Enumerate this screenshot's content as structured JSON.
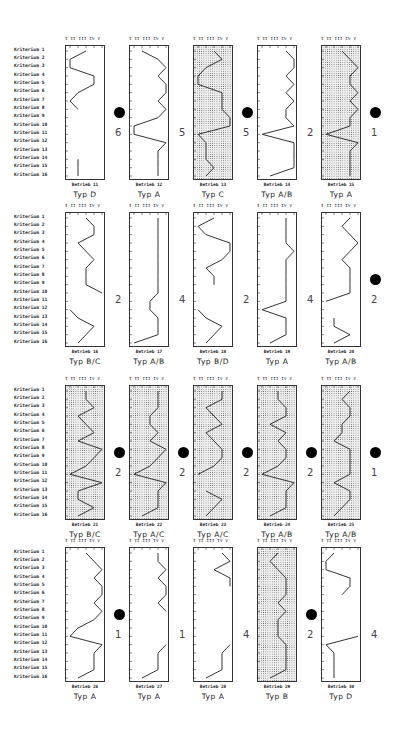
{
  "axis_label": "I  II III IV  V",
  "criteria": [
    "Kriterium  1",
    "Kriterium  2",
    "Kriterium  3",
    "Kriterium  4",
    "Kriterium  5",
    "Kriterium  6",
    "Kriterium  7",
    "Kriterium  8",
    "Kriterium  9",
    "Kriterium 10",
    "Kriterium 11",
    "Kriterium 12",
    "Kriterium 13",
    "Kriterium 14",
    "Kriterium 15",
    "Kriterium 16"
  ],
  "rows": [
    {
      "top": 45,
      "panels": [
        {
          "betrieb": "Betrieb 11",
          "typ": "Typ   D",
          "count": "6",
          "dotted": false,
          "marked": true,
          "values": [
            3,
            1,
            1,
            4,
            4,
            2,
            1,
            2,
            null,
            null,
            null,
            null,
            null,
            2,
            2,
            2
          ],
          "left": 65
        },
        {
          "betrieb": "Betrieb 12",
          "typ": "Typ   A",
          "count": "5",
          "dotted": false,
          "marked": false,
          "values": [
            2,
            4,
            5,
            4,
            5,
            5,
            4,
            5,
            4,
            1,
            1,
            5,
            4,
            4,
            4,
            4
          ],
          "left": 129
        },
        {
          "betrieb": "Betrieb 13",
          "typ": "Typ   C",
          "count": "5",
          "dotted": true,
          "marked": true,
          "values": [
            3,
            4,
            2,
            1,
            1,
            4,
            4,
            4,
            5,
            5,
            1,
            2,
            2,
            2,
            3,
            2
          ],
          "left": 193
        },
        {
          "betrieb": "Betrieb 14",
          "typ": "Typ  A/B",
          "count": "2",
          "dotted": false,
          "marked": false,
          "values": [
            4,
            5,
            5,
            4,
            5,
            4,
            5,
            4,
            4,
            5,
            1,
            5,
            5,
            5,
            5,
            2
          ],
          "left": 257
        },
        {
          "betrieb": "Betrieb 15",
          "typ": "Typ   A",
          "count": "1",
          "dotted": true,
          "marked": true,
          "values": [
            3,
            4,
            5,
            4,
            4,
            5,
            4,
            5,
            4,
            4,
            1,
            5,
            4,
            4,
            4,
            4
          ],
          "left": 321
        }
      ]
    },
    {
      "top": 212,
      "panels": [
        {
          "betrieb": "Betrieb 16",
          "typ": "Typ  B/C",
          "count": "2",
          "dotted": false,
          "marked": false,
          "values": [
            3,
            4,
            4,
            2,
            3,
            4,
            3,
            3,
            3,
            5,
            null,
            1,
            2,
            4,
            3,
            2
          ],
          "left": 65
        },
        {
          "betrieb": "Betrieb 17",
          "typ": "Typ  A/B",
          "count": "4",
          "dotted": false,
          "marked": false,
          "values": [
            4,
            4,
            4,
            4,
            4,
            4,
            4,
            4,
            4,
            4,
            3,
            3,
            4,
            4,
            4,
            1
          ],
          "left": 129
        },
        {
          "betrieb": "Betrieb 18",
          "typ": "Typ  B/D",
          "count": "2",
          "dotted": false,
          "marked": false,
          "values": [
            3,
            1,
            2,
            5,
            5,
            4,
            2,
            3,
            3,
            null,
            null,
            1,
            2,
            4,
            3,
            2
          ],
          "left": 193
        },
        {
          "betrieb": "Betrieb 19",
          "typ": "Typ   A",
          "count": "4",
          "dotted": false,
          "marked": false,
          "values": [
            4,
            4,
            4,
            4,
            5,
            4,
            4,
            4,
            4,
            4,
            4,
            1,
            4,
            4,
            4,
            2
          ],
          "left": 257
        },
        {
          "betrieb": "Betrieb 20",
          "typ": "Typ  A/B",
          "count": "2",
          "dotted": false,
          "marked": true,
          "values": [
            4,
            3,
            4,
            5,
            4,
            3,
            4,
            4,
            4,
            4,
            1,
            null,
            2,
            2,
            4,
            2
          ],
          "left": 321
        }
      ]
    },
    {
      "top": 385,
      "panels": [
        {
          "betrieb": "Betrieb 21",
          "typ": "Typ  B/C",
          "count": "2",
          "dotted": true,
          "marked": true,
          "values": [
            3,
            3,
            4,
            2,
            3,
            4,
            2,
            5,
            4,
            3,
            1,
            5,
            2,
            2,
            4,
            2
          ],
          "left": 65
        },
        {
          "betrieb": "Betrieb 22",
          "typ": "Typ  A/C",
          "count": "2",
          "dotted": true,
          "marked": true,
          "values": [
            4,
            4,
            4,
            3,
            3,
            4,
            3,
            5,
            4,
            3,
            1,
            5,
            4,
            4,
            4,
            2
          ],
          "left": 129
        },
        {
          "betrieb": "Betrieb 23",
          "typ": "Typ  A/C",
          "count": "2",
          "dotted": true,
          "marked": true,
          "values": [
            4,
            4,
            2,
            3,
            4,
            2,
            3,
            4,
            4,
            3,
            1,
            null,
            2,
            4,
            3,
            2
          ],
          "left": 193
        },
        {
          "betrieb": "Betrieb 24",
          "typ": "Typ  A/B",
          "count": "2",
          "dotted": true,
          "marked": true,
          "values": [
            3,
            3,
            4,
            4,
            2,
            4,
            3,
            4,
            4,
            3,
            1,
            5,
            4,
            4,
            4,
            2
          ],
          "left": 257
        },
        {
          "betrieb": "Betrieb 25",
          "typ": "Typ  A/B",
          "count": "1",
          "dotted": true,
          "marked": true,
          "values": [
            4,
            3,
            4,
            4,
            3,
            3,
            2,
            4,
            4,
            4,
            4,
            2,
            4,
            4,
            3,
            2
          ],
          "left": 321
        }
      ]
    },
    {
      "top": 547,
      "panels": [
        {
          "betrieb": "Betrieb 26",
          "typ": "Typ   A",
          "count": "1",
          "dotted": false,
          "marked": true,
          "values": [
            3,
            4,
            5,
            4,
            5,
            5,
            4,
            5,
            4,
            2,
            1,
            5,
            4,
            4,
            4,
            2
          ],
          "left": 65
        },
        {
          "betrieb": "Betrieb 27",
          "typ": "Typ   A",
          "count": "1",
          "dotted": false,
          "marked": false,
          "values": [
            4,
            4,
            5,
            4,
            5,
            5,
            4,
            5,
            null,
            null,
            null,
            5,
            4,
            4,
            4,
            2
          ],
          "left": 129
        },
        {
          "betrieb": "Betrieb 28",
          "typ": "Typ   A",
          "count": "4",
          "dotted": false,
          "marked": false,
          "values": [
            4,
            5,
            3,
            5,
            5,
            null,
            null,
            null,
            null,
            null,
            null,
            5,
            4,
            4,
            4,
            2
          ],
          "left": 193
        },
        {
          "betrieb": "Betrieb 29",
          "typ": "Typ   B",
          "count": "2",
          "dotted": true,
          "marked": true,
          "values": [
            3,
            2,
            3,
            4,
            4,
            4,
            3,
            4,
            3,
            3,
            3,
            4,
            4,
            4,
            4,
            2
          ],
          "left": 257
        },
        {
          "betrieb": "Betrieb 30",
          "typ": "Typ   D",
          "count": "4",
          "dotted": false,
          "marked": false,
          "values": [
            2,
            1,
            1,
            4,
            4,
            3,
            null,
            null,
            null,
            null,
            5,
            1,
            2,
            2,
            2,
            2
          ],
          "left": 321
        }
      ]
    }
  ]
}
